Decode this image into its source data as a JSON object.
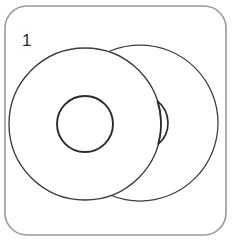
{
  "figure": {
    "label": "1",
    "label_position": "top-left",
    "caption": "",
    "type": "line-drawing"
  },
  "panel": {
    "name": "panel-frame",
    "shape": "rounded-rectangle",
    "x": 5,
    "y": 6,
    "width": 221,
    "height": 229,
    "corner_radius": 22,
    "stroke_color": "#9a9a9a",
    "fill_color": "#ffffff",
    "stroke_width": 1.6
  },
  "shapes": {
    "back_disc": {
      "name": "back-disc",
      "center_x": 140,
      "center_y": 123,
      "radius": 78,
      "stroke_color": "#3b3b3b",
      "fill_color": "#ffffff",
      "occluded": true,
      "hole": {
        "name": "back-disc-hole",
        "center_x": 140,
        "center_y": 123,
        "radius": 28,
        "visible": "partial-crescent"
      }
    },
    "front_disc": {
      "name": "front-disc",
      "center_x": 85,
      "center_y": 124,
      "radius": 76,
      "stroke_color": "#3b3b3b",
      "fill_color": "#ffffff",
      "occluded": false,
      "hole": {
        "name": "front-disc-hole",
        "center_x": 85,
        "center_y": 124,
        "radius": 28,
        "visible": "full",
        "stroke_color": "#2b2b2b"
      }
    }
  },
  "colors": {
    "background": "#ffffff",
    "panel_stroke": "#9a9a9a",
    "disc_stroke": "#3b3b3b",
    "hole_stroke": "#2b2b2b",
    "label_text": "#2b2b2b"
  }
}
